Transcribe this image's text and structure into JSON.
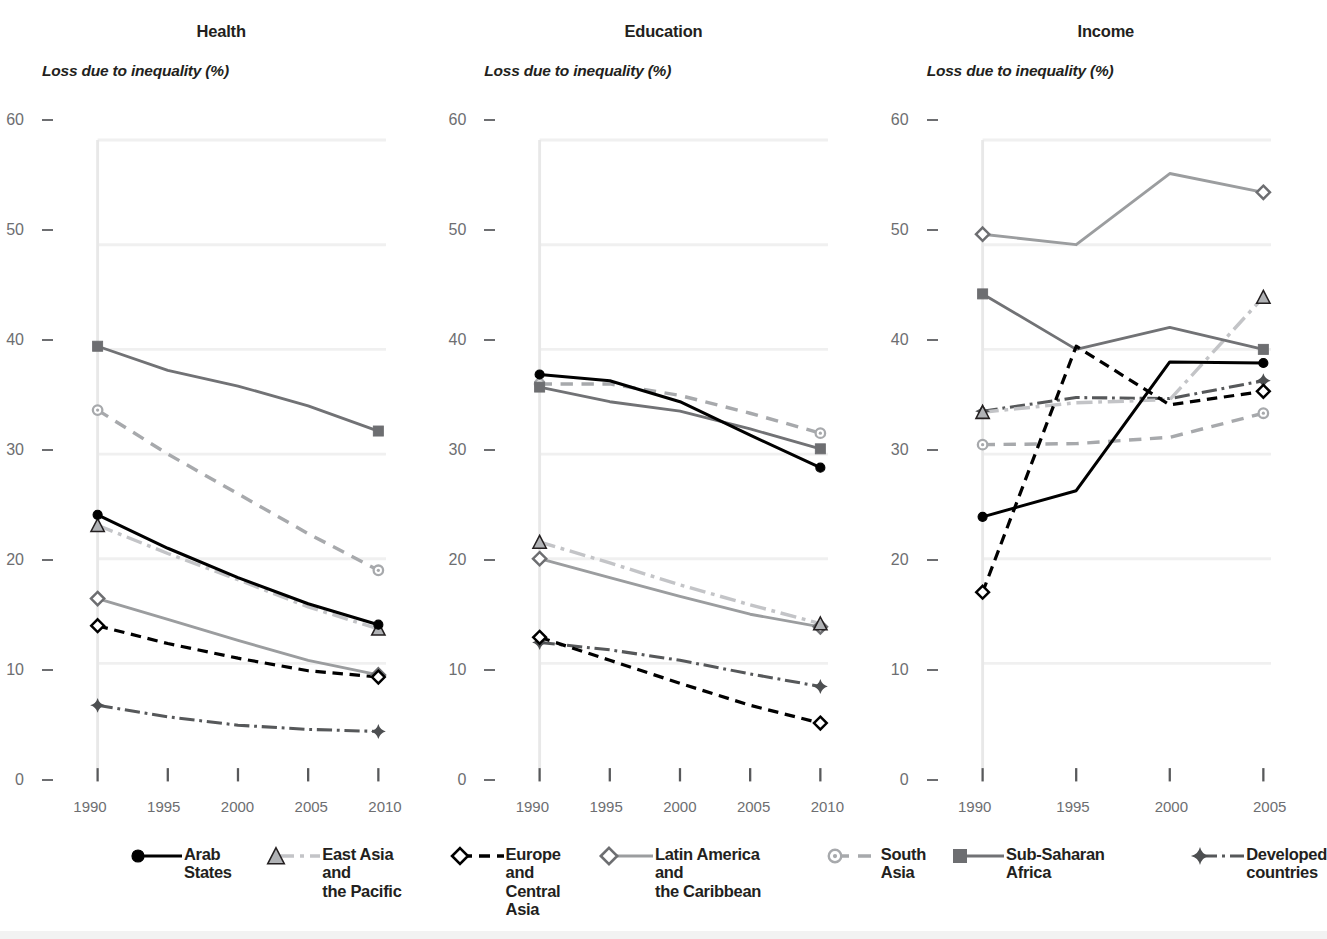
{
  "figure": {
    "y_axis_caption": "Loss due to inequality (%)",
    "y_ticks": [
      "0",
      "10",
      "20",
      "30",
      "40",
      "50",
      "60"
    ],
    "ylim": [
      0,
      60
    ]
  },
  "panels": [
    {
      "title": "Health",
      "x_ticks": [
        "1990",
        "1995",
        "2000",
        "2005",
        "2010"
      ]
    },
    {
      "title": "Education",
      "x_ticks": [
        "1990",
        "1995",
        "2000",
        "2005",
        "2010"
      ]
    },
    {
      "title": "Income",
      "x_ticks": [
        "1990",
        "1995",
        "2000",
        "2005"
      ]
    }
  ],
  "legend": [
    {
      "label": "Arab States",
      "marker": "filled-circle-icon",
      "line": "solid",
      "color": "#000000"
    },
    {
      "label": "East Asia and\nthe Pacific",
      "marker": "filled-triangle-icon",
      "line": "dash-dot",
      "color": "#bcbdc0"
    },
    {
      "label": "Europe and\nCentral Asia",
      "marker": "open-diamond-icon",
      "line": "dashed",
      "color": "#000000"
    },
    {
      "label": "Latin America and\nthe Caribbean",
      "marker": "open-diamond-icon",
      "line": "solid",
      "color": "#939598"
    },
    {
      "label": "South Asia",
      "marker": "dot-circle-icon",
      "line": "dashed",
      "color": "#a7a9ac"
    },
    {
      "label": "Sub-Saharan Africa",
      "marker": "filled-square-icon",
      "line": "solid",
      "color": "#6d6e71"
    },
    {
      "label": "Developed\ncountries",
      "marker": "plus-star-icon",
      "line": "dash-dot",
      "color": "#58595b"
    }
  ],
  "chart_data": [
    {
      "type": "line",
      "title": "Health",
      "xlabel": "",
      "ylabel": "Loss due to inequality (%)",
      "x": [
        1990,
        1995,
        2000,
        2005,
        2010
      ],
      "xlim": [
        1990,
        2010
      ],
      "ylim": [
        0,
        60
      ],
      "yticks": [
        0,
        10,
        20,
        30,
        40,
        50,
        60
      ],
      "grid": true,
      "legend_position": "bottom",
      "series": [
        {
          "name": "Arab States",
          "values": [
            24.2,
            21.0,
            18.2,
            15.7,
            13.7
          ]
        },
        {
          "name": "East Asia and the Pacific",
          "values": [
            23.2,
            20.5,
            18.0,
            15.4,
            13.3
          ]
        },
        {
          "name": "Europe and Central Asia",
          "values": [
            13.6,
            11.9,
            10.5,
            9.3,
            8.7
          ]
        },
        {
          "name": "Latin America and the Caribbean",
          "values": [
            16.2,
            14.2,
            12.2,
            10.3,
            8.9
          ]
        },
        {
          "name": "South Asia",
          "values": [
            34.2,
            30.0,
            26.2,
            22.4,
            18.9
          ]
        },
        {
          "name": "Sub-Saharan Africa",
          "values": [
            40.3,
            38.0,
            36.5,
            34.6,
            32.2
          ]
        },
        {
          "name": "Developed countries",
          "values": [
            6.0,
            4.9,
            4.1,
            3.7,
            3.5
          ]
        }
      ]
    },
    {
      "type": "line",
      "title": "Education",
      "xlabel": "",
      "ylabel": "Loss due to inequality (%)",
      "x": [
        1990,
        1995,
        2000,
        2005,
        2010
      ],
      "xlim": [
        1990,
        2010
      ],
      "ylim": [
        0,
        60
      ],
      "yticks": [
        0,
        10,
        20,
        30,
        40,
        50,
        60
      ],
      "grid": true,
      "legend_position": "bottom",
      "series": [
        {
          "name": "Arab States",
          "values": [
            37.6,
            37.0,
            35.0,
            31.8,
            28.7
          ]
        },
        {
          "name": "East Asia and the Pacific",
          "values": [
            21.6,
            19.6,
            17.5,
            15.6,
            13.8
          ]
        },
        {
          "name": "Europe and Central Asia",
          "values": [
            12.5,
            10.3,
            8.1,
            6.0,
            4.3
          ]
        },
        {
          "name": "Latin America and the Caribbean",
          "values": [
            20.0,
            18.2,
            16.4,
            14.7,
            13.5
          ]
        },
        {
          "name": "South Asia",
          "values": [
            36.7,
            36.7,
            35.6,
            33.9,
            32.0
          ]
        },
        {
          "name": "Sub-Saharan Africa",
          "values": [
            36.4,
            35.0,
            34.1,
            32.4,
            30.5
          ]
        },
        {
          "name": "Developed countries",
          "values": [
            12.0,
            11.3,
            10.3,
            9.0,
            7.8
          ]
        }
      ]
    },
    {
      "type": "line",
      "title": "Income",
      "xlabel": "",
      "ylabel": "Loss due to inequality (%)",
      "x": [
        1990,
        1995,
        2000,
        2005
      ],
      "xlim": [
        1990,
        2005
      ],
      "ylim": [
        0,
        60
      ],
      "yticks": [
        0,
        10,
        20,
        30,
        40,
        50,
        60
      ],
      "grid": true,
      "legend_position": "bottom",
      "series": [
        {
          "name": "Arab States",
          "values": [
            24.0,
            26.5,
            38.8,
            38.7
          ]
        },
        {
          "name": "East Asia and the Pacific",
          "values": [
            34.0,
            34.9,
            35.2,
            45.0
          ]
        },
        {
          "name": "Europe and Central Asia",
          "values": [
            16.8,
            40.3,
            34.7,
            36.0
          ]
        },
        {
          "name": "Latin America and the Caribbean",
          "values": [
            51.0,
            50.0,
            56.8,
            55.0
          ]
        },
        {
          "name": "South Asia",
          "values": [
            30.9,
            31.0,
            31.6,
            33.9
          ]
        },
        {
          "name": "Sub-Saharan Africa",
          "values": [
            45.3,
            40.0,
            42.1,
            40.0
          ]
        },
        {
          "name": "Developed countries",
          "values": [
            34.1,
            35.4,
            35.3,
            37.0
          ]
        }
      ]
    }
  ]
}
